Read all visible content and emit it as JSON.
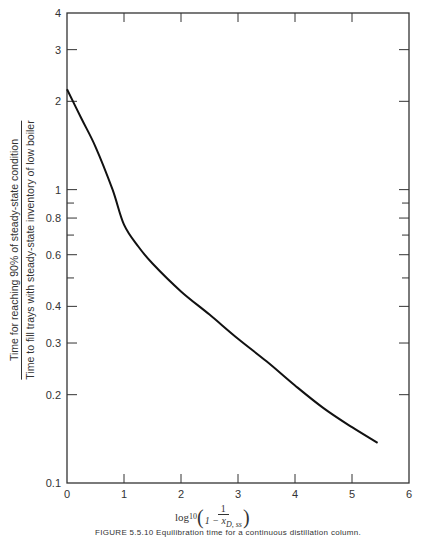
{
  "chart_data": {
    "type": "line",
    "title": "",
    "xlabel": "log10(1 / (1 - x_D,ss))",
    "ylabel": "Time for reaching 90% of steady-state condition / Time to fill trays with steady-state inventory of low boiler",
    "xlim": [
      0,
      6
    ],
    "ylim": [
      0.1,
      4
    ],
    "yscale": "log",
    "grid": false,
    "x_ticks": [
      "0",
      "1",
      "2",
      "3",
      "4",
      "5",
      "6"
    ],
    "y_ticks": [
      "0.1",
      "0.2",
      "0.3",
      "0.4",
      "0.6",
      "0.8",
      "1",
      "2",
      "3",
      "4"
    ],
    "series": [
      {
        "name": "curve",
        "x": [
          0,
          0.25,
          0.5,
          0.8,
          1.0,
          1.25,
          1.5,
          2.0,
          2.5,
          3.0,
          3.5,
          4.0,
          4.5,
          5.0,
          5.45
        ],
        "y": [
          2.2,
          1.75,
          1.4,
          1.0,
          0.76,
          0.64,
          0.56,
          0.45,
          0.375,
          0.31,
          0.26,
          0.215,
          0.18,
          0.155,
          0.137
        ]
      }
    ]
  },
  "axis": {
    "y_ticks": [
      {
        "label": "4",
        "value": 4
      },
      {
        "label": "3",
        "value": 3
      },
      {
        "label": "2",
        "value": 2
      },
      {
        "label": "1",
        "value": 1
      },
      {
        "label": "0.8",
        "value": 0.8
      },
      {
        "label": "0.6",
        "value": 0.6
      },
      {
        "label": "0.4",
        "value": 0.4
      },
      {
        "label": "0.3",
        "value": 0.3
      },
      {
        "label": "0.2",
        "value": 0.2
      },
      {
        "label": "0.1",
        "value": 0.1
      }
    ],
    "x_ticks": [
      "0",
      "1",
      "2",
      "3",
      "4",
      "5",
      "6"
    ]
  },
  "labels": {
    "ylabel_numerator": "Time for reaching 90% of steady-state condition",
    "ylabel_denominator": "Time to fill trays with steady-state inventory of low boiler",
    "xlabel_log": "log",
    "xlabel_sub": "10",
    "xlabel_frac_num": "1",
    "xlabel_frac_den": "1 − x",
    "xlabel_frac_den_sub": "D, ss",
    "caption": "FIGURE 5.5.10   Equilibration time for a continuous distillation column."
  }
}
